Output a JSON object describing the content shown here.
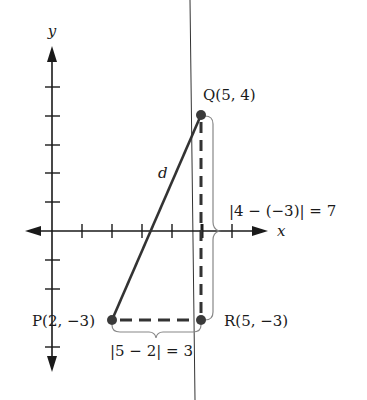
{
  "diagram": {
    "type": "coordinate-plane distance diagram",
    "axes": {
      "x_label": "x",
      "y_label": "y"
    },
    "points": {
      "P": {
        "name": "P",
        "coords": "(2, −3)",
        "label": "P(2, −3)"
      },
      "Q": {
        "name": "Q",
        "coords": "(5, 4)",
        "label": "Q(5, 4)"
      },
      "R": {
        "name": "R",
        "coords": "(5, −3)",
        "label": "R(5, −3)"
      }
    },
    "segments": {
      "hypotenuse_label": "d",
      "vertical_distance_label": "|4 − (−3)| = 7",
      "horizontal_distance_label": "|5 − 2| = 3"
    },
    "colors": {
      "axis": "#1a1a1a",
      "segment": "#333333",
      "dashed": "#333333",
      "brace": "#888888",
      "point": "#3a3a3a",
      "overlay_line": "#333333"
    }
  }
}
